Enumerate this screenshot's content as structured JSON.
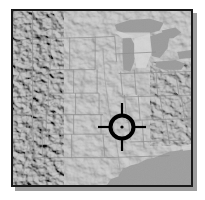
{
  "view": {
    "kind": "shaded-relief-locator-map",
    "title": "Shaded relief locator map of the central United States",
    "background_color": "#ffffff",
    "frame_border_color": "#1a1a1a",
    "frame_shadow_color": "#9d9d9d",
    "frame": {
      "x": 11,
      "y": 9,
      "width": 182,
      "height": 178
    }
  },
  "map": {
    "name": "central-united-states-relief",
    "projection_look": "equirectangular",
    "terrain_base_color": "#cfcfcf",
    "land_light_color": "#dedede",
    "land_mid_color": "#c6c6c6",
    "land_dark_color": "#a9a9a9",
    "water_color": "#9a9a9a",
    "border_line_color": "#8a8a8a",
    "regions": [
      {
        "name": "rocky-mountains",
        "label": "Rocky Mountains",
        "position": "west"
      },
      {
        "name": "great-plains",
        "label": "Great Plains",
        "position": "center"
      },
      {
        "name": "great-lakes",
        "label": "Great Lakes",
        "position": "northeast"
      },
      {
        "name": "gulf-of-mexico",
        "label": "Gulf of Mexico",
        "position": "southeast"
      },
      {
        "name": "appalachians",
        "label": "Appalachian Mountains",
        "position": "east"
      }
    ]
  },
  "marker": {
    "name": "crosshair-target",
    "label": "Target location",
    "color": "#000000",
    "center_x": 120,
    "center_y": 125,
    "ring_radius": 13,
    "ring_stroke": 4,
    "tick_length": 12,
    "dot_radius": 1.6
  }
}
